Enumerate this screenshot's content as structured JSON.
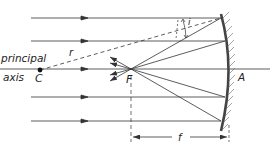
{
  "diagram": {
    "labels": {
      "principal": "principal",
      "axis": "axis",
      "center": "C",
      "focus": "F",
      "vertex": "A",
      "radius": "r",
      "angle_incidence": "i",
      "focal_length": "f"
    },
    "colors": {
      "line": "#333333",
      "mirror": "#444444",
      "background": "#ffffff"
    }
  }
}
